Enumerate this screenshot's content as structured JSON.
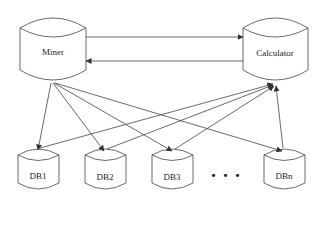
{
  "nodes": {
    "miner": {
      "label": "Miner"
    },
    "calculator": {
      "label": "Calculator"
    },
    "db1": {
      "label": "DB1"
    },
    "db2": {
      "label": "DB2"
    },
    "db3": {
      "label": "DB3"
    },
    "dbn": {
      "label": "DBn"
    }
  },
  "ellipsis": "• • •",
  "edges": [
    {
      "from": "miner",
      "to": "calculator"
    },
    {
      "from": "calculator",
      "to": "miner"
    },
    {
      "from": "miner",
      "to": "db1"
    },
    {
      "from": "miner",
      "to": "db2"
    },
    {
      "from": "miner",
      "to": "db3"
    },
    {
      "from": "miner",
      "to": "dbn"
    },
    {
      "from": "db1",
      "to": "calculator"
    },
    {
      "from": "db2",
      "to": "calculator"
    },
    {
      "from": "db3",
      "to": "calculator"
    },
    {
      "from": "dbn",
      "to": "calculator"
    }
  ]
}
